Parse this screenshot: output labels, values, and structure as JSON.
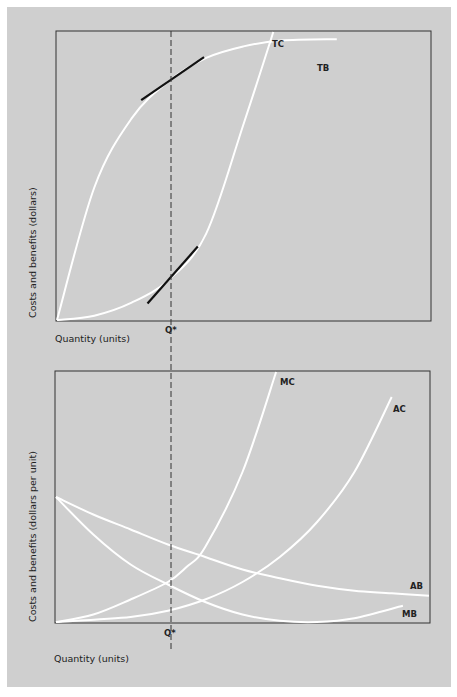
{
  "chart_data": [
    {
      "type": "line",
      "title": "",
      "xlabel": "Quantity (units)",
      "ylabel": "Costs and benefits (dollars)",
      "xlim": [
        0,
        10
      ],
      "ylim": [
        0,
        10
      ],
      "grid": false,
      "marker": {
        "label": "Q*",
        "x": 3.1,
        "style": "dashed vertical line"
      },
      "series": [
        {
          "name": "TB",
          "label": "TB",
          "x": [
            0,
            1,
            2,
            3,
            4,
            5,
            6,
            7.5
          ],
          "y": [
            0,
            4.6,
            7.0,
            8.3,
            9.1,
            9.5,
            9.7,
            9.75
          ]
        },
        {
          "name": "TC",
          "label": "TC",
          "x": [
            0,
            1,
            2,
            3,
            4,
            5,
            5.8
          ],
          "y": [
            0,
            0.15,
            0.6,
            1.4,
            3.0,
            6.8,
            10
          ]
        }
      ],
      "tangents": [
        {
          "curve": "TB",
          "at_x": 3.1
        },
        {
          "curve": "TC",
          "at_x": 3.1
        }
      ]
    },
    {
      "type": "line",
      "title": "",
      "xlabel": "Quantity (units)",
      "ylabel": "Costs and benefits (dollars per unit)",
      "xlim": [
        0,
        10
      ],
      "ylim": [
        0,
        10
      ],
      "grid": false,
      "marker": {
        "label": "Q*",
        "x": 3.1,
        "style": "dashed vertical line"
      },
      "series": [
        {
          "name": "MC",
          "label": "MC",
          "x": [
            0,
            1,
            2,
            3,
            3.5,
            4,
            5,
            5.9
          ],
          "y": [
            0,
            0.3,
            0.9,
            1.6,
            2.2,
            3.0,
            6.0,
            10
          ]
        },
        {
          "name": "AC",
          "label": "AC",
          "x": [
            0,
            2,
            3,
            4,
            5,
            6,
            7,
            8,
            9
          ],
          "y": [
            0,
            0.2,
            0.45,
            0.9,
            1.6,
            2.6,
            4.0,
            6.0,
            9.0
          ]
        },
        {
          "name": "AB",
          "label": "AB",
          "x": [
            0,
            1,
            2,
            3,
            4,
            5,
            6,
            7,
            8,
            9,
            10
          ],
          "y": [
            5.0,
            4.3,
            3.7,
            3.1,
            2.6,
            2.1,
            1.75,
            1.45,
            1.25,
            1.15,
            1.05
          ]
        },
        {
          "name": "MB",
          "label": "MB",
          "x": [
            0,
            1,
            2,
            3,
            4,
            5,
            6,
            7,
            8,
            9.3
          ],
          "y": [
            5.0,
            3.5,
            2.3,
            1.5,
            0.8,
            0.3,
            0.05,
            0.0,
            0.15,
            0.65
          ]
        }
      ]
    }
  ]
}
